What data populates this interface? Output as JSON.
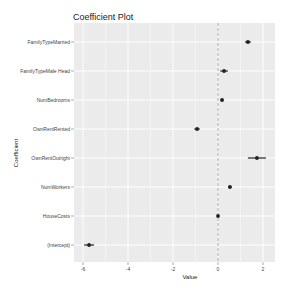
{
  "chart_data": {
    "type": "scatter",
    "title": "Coefficient Plot",
    "xlabel": "Value",
    "ylabel": "Coefficient",
    "xlim": [
      -6.5,
      2.5
    ],
    "xticks": [
      -6,
      -4,
      -2,
      0,
      2
    ],
    "reference_line": 0,
    "grid": true,
    "categories": [
      "FamilyTypeMarried",
      "FamilyTypeMale Head",
      "NumBedrooms",
      "OwnRentRented",
      "OwnRentOutright",
      "NumWorkers",
      "HouseCosts",
      "(Intercept)"
    ],
    "values": [
      1.33,
      0.27,
      0.18,
      -0.93,
      1.73,
      0.53,
      0.0,
      -5.73
    ],
    "ci_low": [
      1.2,
      0.1,
      0.12,
      -1.05,
      1.33,
      0.45,
      -0.03,
      -5.95
    ],
    "ci_high": [
      1.46,
      0.44,
      0.24,
      -0.81,
      2.13,
      0.61,
      0.03,
      -5.51
    ]
  },
  "colors": {
    "panel": "#ebebeb",
    "grid": "#ffffff",
    "point": "#222222",
    "refline": "#999999"
  }
}
